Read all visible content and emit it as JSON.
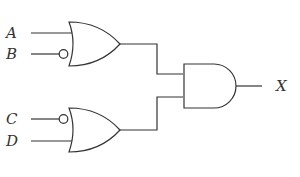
{
  "diagram": {
    "type": "logic-circuit",
    "inputs": [
      {
        "label": "A",
        "gate": "or-top",
        "inverted": false
      },
      {
        "label": "B",
        "gate": "or-top",
        "inverted": true
      },
      {
        "label": "C",
        "gate": "or-bottom",
        "inverted": true
      },
      {
        "label": "D",
        "gate": "or-bottom",
        "inverted": false
      }
    ],
    "gates": [
      {
        "id": "or-top",
        "kind": "OR",
        "inputs": [
          "A",
          "NOT B"
        ]
      },
      {
        "id": "or-bottom",
        "kind": "OR",
        "inputs": [
          "NOT C",
          "D"
        ]
      },
      {
        "id": "and-out",
        "kind": "AND",
        "inputs": [
          "or-top",
          "or-bottom"
        ]
      }
    ],
    "output": {
      "label": "X",
      "gate": "and-out"
    },
    "colors": {
      "line": "#333333",
      "background": "#ffffff"
    }
  }
}
